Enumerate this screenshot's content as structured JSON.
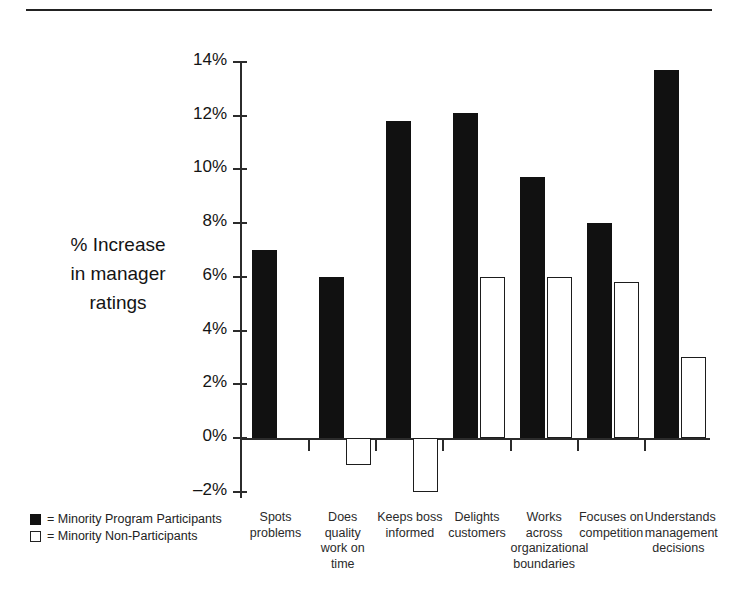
{
  "chart_data": {
    "type": "bar",
    "title": "",
    "subtitle": "",
    "xlabel": "",
    "ylabel": "% Increase in manager ratings",
    "ylim": [
      -2,
      14
    ],
    "ytick_labels": [
      "14%",
      "12%",
      "10%",
      "8%",
      "6%",
      "4%",
      "2%",
      "0%",
      "–2%"
    ],
    "ytick_values": [
      14,
      12,
      10,
      8,
      6,
      4,
      2,
      0,
      -2
    ],
    "grid": false,
    "legend_position": "bottom-left",
    "categories": [
      "Spots problems",
      "Does quality work on time",
      "Keeps boss informed",
      "Delights customers",
      "Works across organizational boundaries",
      "Focuses on competition",
      "Understands management decisions"
    ],
    "category_label_lines": [
      [
        "Spots",
        "problems"
      ],
      [
        "Does quality",
        "work on time"
      ],
      [
        "Keeps boss",
        "informed"
      ],
      [
        "Delights",
        "customers"
      ],
      [
        "Works across",
        "organizational",
        "boundaries"
      ],
      [
        "Focuses on",
        "competition"
      ],
      [
        "Understands",
        "management",
        "decisions"
      ]
    ],
    "series": [
      {
        "name": "Minority Program Participants",
        "color": "#111111",
        "style": "filled",
        "values": [
          7.0,
          6.0,
          11.8,
          12.1,
          9.7,
          8.0,
          13.7
        ]
      },
      {
        "name": "Minority Non-Participants",
        "color": "#ffffff",
        "style": "hollow",
        "values": [
          null,
          -1.0,
          -2.0,
          6.0,
          6.0,
          5.8,
          3.0
        ]
      }
    ]
  },
  "legend": {
    "items": [
      {
        "style": "filled",
        "label": "= Minority Program Participants"
      },
      {
        "style": "hollow",
        "label": "= Minority Non-Participants"
      }
    ]
  },
  "axis": {
    "y_title_lines": [
      "% Increase",
      "in manager",
      "ratings"
    ]
  }
}
